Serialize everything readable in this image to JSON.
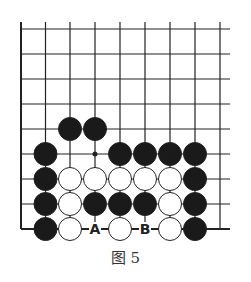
{
  "diagram": {
    "caption": "图 5",
    "grid": {
      "x_lines": [
        21,
        45.5,
        70,
        95,
        120,
        145,
        170,
        195,
        220
      ],
      "y_lines": [
        29,
        54,
        79,
        104,
        129,
        154,
        179,
        204,
        229
      ],
      "left_edge": true,
      "bottom_edge": true
    },
    "colors": {
      "line": "#222222",
      "black_stone": "#1a1a1a",
      "white_stone": "#ffffff"
    },
    "star_point": {
      "col": 3,
      "row": 5
    },
    "stones": [
      {
        "color": "black",
        "col": 2,
        "row": 4
      },
      {
        "color": "black",
        "col": 3,
        "row": 4
      },
      {
        "color": "black",
        "col": 1,
        "row": 5
      },
      {
        "color": "black",
        "col": 4,
        "row": 5
      },
      {
        "color": "black",
        "col": 5,
        "row": 5
      },
      {
        "color": "black",
        "col": 6,
        "row": 5
      },
      {
        "color": "black",
        "col": 7,
        "row": 5
      },
      {
        "color": "black",
        "col": 1,
        "row": 6
      },
      {
        "color": "white",
        "col": 2,
        "row": 6
      },
      {
        "color": "white",
        "col": 3,
        "row": 6
      },
      {
        "color": "white",
        "col": 4,
        "row": 6
      },
      {
        "color": "white",
        "col": 5,
        "row": 6
      },
      {
        "color": "white",
        "col": 6,
        "row": 6
      },
      {
        "color": "black",
        "col": 7,
        "row": 6
      },
      {
        "color": "black",
        "col": 1,
        "row": 7
      },
      {
        "color": "white",
        "col": 2,
        "row": 7
      },
      {
        "color": "black",
        "col": 3,
        "row": 7
      },
      {
        "color": "black",
        "col": 4,
        "row": 7
      },
      {
        "color": "black",
        "col": 5,
        "row": 7
      },
      {
        "color": "white",
        "col": 6,
        "row": 7
      },
      {
        "color": "black",
        "col": 7,
        "row": 7
      },
      {
        "color": "black",
        "col": 1,
        "row": 8
      },
      {
        "color": "white",
        "col": 2,
        "row": 8
      },
      {
        "color": "white",
        "col": 4,
        "row": 8
      },
      {
        "color": "white",
        "col": 6,
        "row": 8
      },
      {
        "color": "black",
        "col": 7,
        "row": 8
      }
    ],
    "labels": [
      {
        "text": "A",
        "col": 3,
        "row": 8
      },
      {
        "text": "B",
        "col": 5,
        "row": 8
      }
    ]
  }
}
